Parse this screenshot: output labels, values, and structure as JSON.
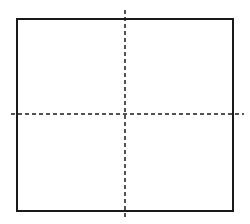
{
  "diagram": {
    "type": "square-with-crosshair",
    "colors": {
      "stroke": "#1a1a1a",
      "background": "#ffffff"
    },
    "square": {
      "x": 17,
      "y": 19,
      "width": 216,
      "height": 192,
      "stroke_width": 2
    },
    "vertical_axis": {
      "x": 125,
      "y1": 10,
      "y2": 218,
      "dash": "4 3",
      "stroke_width": 1.5
    },
    "horizontal_axis": {
      "y": 114,
      "x1": 11,
      "x2": 244,
      "dash": "4 3",
      "stroke_width": 1.5
    }
  }
}
